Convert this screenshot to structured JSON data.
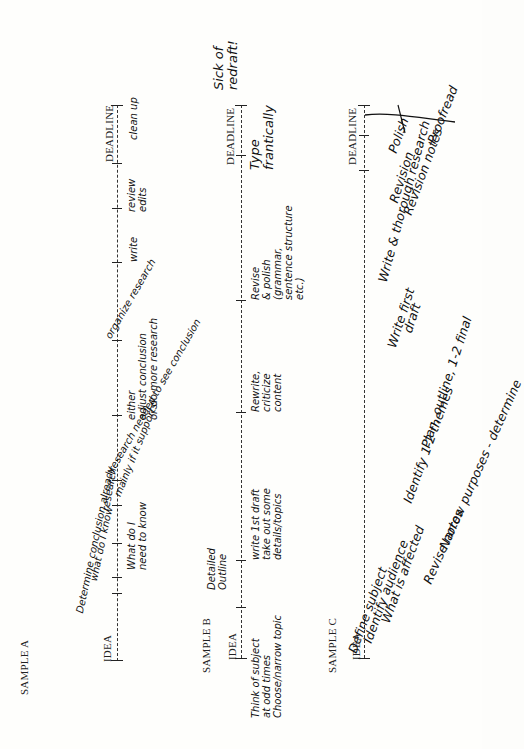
{
  "samples": [
    {
      "title": "SAMPLE A",
      "start_label": "IDEA",
      "end_label": "DEADLINE",
      "notes_below": [
        "What do I\nneed to know",
        "either\nadjust conclusion\nor do more research",
        "write",
        "review\nedits",
        "clean up"
      ],
      "notes_above": [
        "Determine conclusion already",
        "what do I know",
        "research",
        "mainly if it supports",
        "research needed to see conclusion",
        "organize research"
      ]
    },
    {
      "title": "SAMPLE B",
      "start_label": "IDEA",
      "end_label": "DEADLINE",
      "notes_above": [
        "Detailed\nOutline",
        "Sick of\nredraft!"
      ],
      "notes_below": [
        "Think of subject\nat odd times\nChoose/narrow topic",
        "write 1st draft\ntake out some\ndetails/topics",
        "Rewrite,\ncriticize\ncontent",
        "Revise\n& polish\n(grammar,\nsentence structure\netc.)",
        "Type\nfrantically"
      ]
    },
    {
      "title": "SAMPLE C",
      "start_label": "IDEA",
      "end_label": "DEADLINE",
      "notes_diagonal": [
        "Define subject",
        "Identify audience",
        "What is affected",
        "Revise notes",
        "Narrow purposes - determine",
        "Identify 1-2 themes",
        "Plan, outline, 1-2 final",
        "Write first",
        "draft",
        "Write & thorough research",
        "Revision",
        "Polish",
        "Proofread",
        "Revision notes"
      ]
    }
  ]
}
